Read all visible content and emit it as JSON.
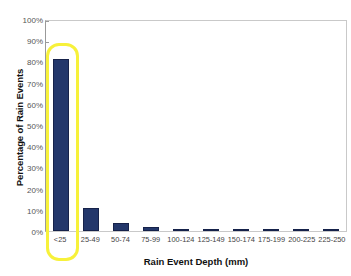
{
  "chart_data": {
    "type": "bar",
    "title": "",
    "xlabel": "Rain Event Depth (mm)",
    "ylabel": "Percentage of Rain Events",
    "categories": [
      "<25",
      "25-49",
      "50-74",
      "75-99",
      "100-124",
      "125-149",
      "150-174",
      "175-199",
      "200-225",
      "225-250"
    ],
    "values": [
      81,
      11,
      4,
      2,
      1,
      0.5,
      0.5,
      0.2,
      0.2,
      0.2
    ],
    "ylim": [
      0,
      100
    ],
    "y_ticks": [
      "0%",
      "10%",
      "20%",
      "30%",
      "40%",
      "50%",
      "60%",
      "70%",
      "80%",
      "90%",
      "100%"
    ],
    "y_tick_values": [
      0,
      10,
      20,
      30,
      40,
      50,
      60,
      70,
      80,
      90,
      100
    ],
    "grid": false,
    "legend": "none",
    "bar_color": "#23376b",
    "bar_border_color": "#16224a",
    "highlight": {
      "category": "<25",
      "color": "#f7f13a"
    }
  }
}
